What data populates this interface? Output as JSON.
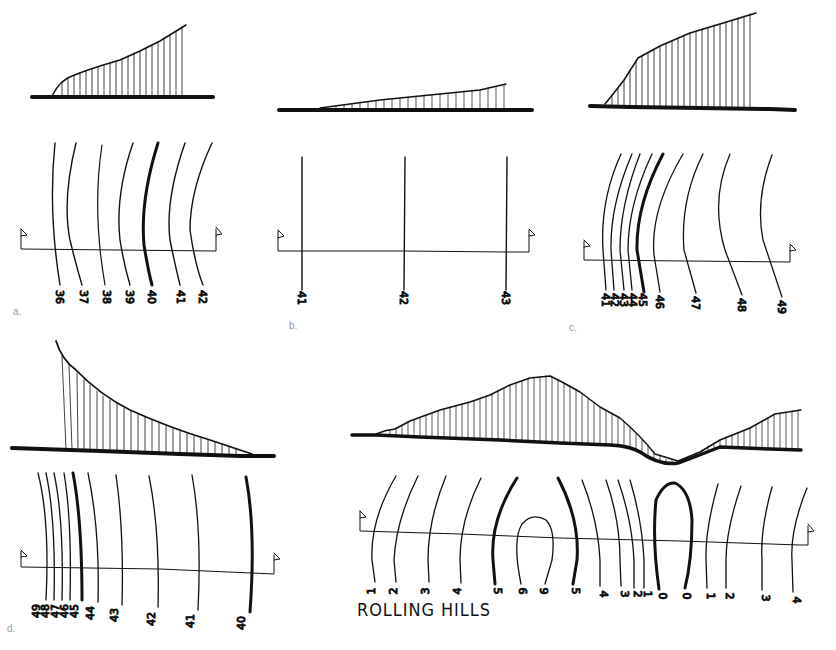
{
  "figure": {
    "title": "ROLLING HILLS",
    "panels": [
      {
        "id": "a",
        "letter": "a.",
        "description": "Gradual slope rising to the right",
        "contour_labels": [
          "36",
          "37",
          "38",
          "39",
          "40",
          "41",
          "42"
        ],
        "index_contour": "40"
      },
      {
        "id": "b",
        "letter": "b.",
        "description": "Very gentle uniform slope",
        "contour_labels": [
          "41",
          "42",
          "43"
        ],
        "index_contour": ""
      },
      {
        "id": "c",
        "letter": "c.",
        "description": "Steep slope flattening at top (convex)",
        "contour_labels": [
          "41",
          "42",
          "43",
          "44",
          "45",
          "46",
          "47",
          "48",
          "49"
        ],
        "index_contour": "45"
      },
      {
        "id": "d",
        "letter": "d.",
        "description": "Steep slope flattening at bottom (concave)",
        "contour_labels": [
          "49",
          "48",
          "47",
          "46",
          "45",
          "44",
          "43",
          "42",
          "41",
          "40"
        ],
        "index_contour": "45"
      },
      {
        "id": "rolling-hills",
        "letter": "",
        "description": "Rolling hills: hilltop and valley",
        "contour_labels": [
          "1",
          "2",
          "3",
          "4",
          "5",
          "6",
          "6",
          "5",
          "4",
          "3",
          "2",
          "1",
          "0",
          "0",
          "1",
          "2",
          "3",
          "4"
        ],
        "index_contour": "5"
      }
    ],
    "colors": {
      "ink": "#111111",
      "paper": "#ffffff",
      "letter": "#9a9a9a"
    }
  }
}
